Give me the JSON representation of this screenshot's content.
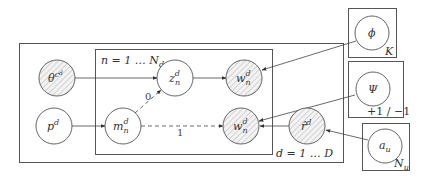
{
  "diagram": {
    "type": "plate-notation-graphical-model",
    "colors": {
      "stroke": "#555555",
      "hatch": "#bdbdbd",
      "text": "#333333",
      "background": "#ffffff"
    },
    "plates": {
      "outer": {
        "label": "d = 1 … D"
      },
      "inner": {
        "label": "n = 1 … N",
        "label_sub": "d"
      },
      "phi_plate": {
        "label": "K"
      },
      "psi_plate": {
        "label": "+1 / −1"
      },
      "a_plate": {
        "label": "N",
        "label_sub": "u"
      }
    },
    "nodes": {
      "theta": {
        "label": "θ",
        "label_sup": "c",
        "label_sup2": "d",
        "observed": true
      },
      "p": {
        "label": "p",
        "label_sup": "d",
        "observed": false
      },
      "z": {
        "label": "z",
        "label_sup": "d",
        "label_sub": "n",
        "observed": false
      },
      "w_top": {
        "label": "w",
        "label_sup": "d",
        "label_sub": "n",
        "observed": true
      },
      "m": {
        "label": "m",
        "label_sup": "d",
        "label_sub": "n",
        "observed": false
      },
      "w_bottom": {
        "label": "w",
        "label_sup": "d",
        "label_sub": "n",
        "observed": true
      },
      "r_hat": {
        "label": "r̂",
        "label_sup": "d",
        "observed": true
      },
      "phi": {
        "label": "ϕ",
        "observed": false
      },
      "psi": {
        "label": "Ψ",
        "observed": false
      },
      "a_u": {
        "label": "a",
        "label_sub": "u",
        "observed": false
      }
    },
    "edges": [
      {
        "from": "theta",
        "to": "z",
        "style": "solid"
      },
      {
        "from": "z",
        "to": "w_top",
        "style": "solid"
      },
      {
        "from": "phi",
        "to": "w_top",
        "style": "solid"
      },
      {
        "from": "p",
        "to": "m",
        "style": "solid"
      },
      {
        "from": "m",
        "to": "z",
        "style": "dashed",
        "label": "0"
      },
      {
        "from": "m",
        "to": "w_bottom",
        "style": "dashed",
        "label": "1"
      },
      {
        "from": "psi",
        "to": "w_bottom",
        "style": "solid"
      },
      {
        "from": "r_hat",
        "to": "w_bottom",
        "style": "solid"
      },
      {
        "from": "a_u",
        "to": "r_hat",
        "style": "solid"
      }
    ]
  }
}
